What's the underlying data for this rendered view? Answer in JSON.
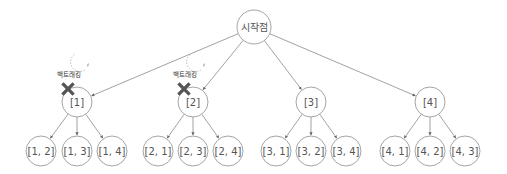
{
  "diagram": {
    "type": "tree",
    "root": {
      "id": "root",
      "label": "시작점",
      "x": 254,
      "y": 27,
      "r": 17
    },
    "level1": [
      {
        "id": "n1",
        "label": "[1]",
        "x": 77,
        "y": 102,
        "r": 15,
        "backtracked": true
      },
      {
        "id": "n2",
        "label": "[2]",
        "x": 193,
        "y": 102,
        "r": 15,
        "backtracked": true
      },
      {
        "id": "n3",
        "label": "[3]",
        "x": 311,
        "y": 102,
        "r": 15,
        "backtracked": false
      },
      {
        "id": "n4",
        "label": "[4]",
        "x": 430,
        "y": 102,
        "r": 15,
        "backtracked": false
      }
    ],
    "level2": [
      {
        "parent": "n1",
        "label": "[1, 2]",
        "x": 41,
        "y": 151,
        "r": 15
      },
      {
        "parent": "n1",
        "label": "[1, 3]",
        "x": 77,
        "y": 151,
        "r": 15
      },
      {
        "parent": "n1",
        "label": "[1, 4]",
        "x": 112,
        "y": 151,
        "r": 15
      },
      {
        "parent": "n2",
        "label": "[2, 1]",
        "x": 158,
        "y": 151,
        "r": 15
      },
      {
        "parent": "n2",
        "label": "[2, 3]",
        "x": 193,
        "y": 151,
        "r": 15
      },
      {
        "parent": "n2",
        "label": "[2, 4]",
        "x": 228,
        "y": 151,
        "r": 15
      },
      {
        "parent": "n3",
        "label": "[3, 1]",
        "x": 276,
        "y": 151,
        "r": 15
      },
      {
        "parent": "n3",
        "label": "[3, 2]",
        "x": 311,
        "y": 151,
        "r": 15
      },
      {
        "parent": "n3",
        "label": "[3, 4]",
        "x": 346,
        "y": 151,
        "r": 15
      },
      {
        "parent": "n4",
        "label": "[4, 1]",
        "x": 395,
        "y": 151,
        "r": 15
      },
      {
        "parent": "n4",
        "label": "[4, 2]",
        "x": 430,
        "y": 151,
        "r": 15
      },
      {
        "parent": "n4",
        "label": "[4, 3]",
        "x": 465,
        "y": 151,
        "r": 15
      }
    ],
    "annotations": [
      {
        "for": "n1",
        "label": "백트래킹",
        "icon": "x-mark-icon"
      },
      {
        "for": "n2",
        "label": "백트래킹",
        "icon": "x-mark-icon"
      }
    ],
    "colors": {
      "node_stroke": "#9a9a9a",
      "edge": "#8a8a8a",
      "x_mark": "#555555",
      "text": "#555555"
    }
  }
}
